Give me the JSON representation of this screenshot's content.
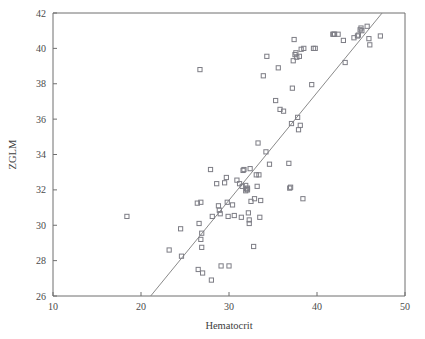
{
  "chart_data": {
    "type": "scatter",
    "title": "",
    "xlabel": "Hematocrit",
    "ylabel": "ZGLM",
    "xlim": [
      10,
      50
    ],
    "ylim": [
      26,
      42
    ],
    "xticks": [
      10,
      20,
      30,
      40,
      50
    ],
    "yticks": [
      26,
      28,
      30,
      32,
      34,
      36,
      38,
      40,
      42
    ],
    "grid": false,
    "legend": null,
    "marker_style": "open-square",
    "fit_line": {
      "label": "regression-line",
      "x": [
        21.1,
        47.4
      ],
      "y": [
        26.0,
        42.0
      ]
    },
    "points": [
      [
        18.4,
        30.5
      ],
      [
        23.2,
        28.6
      ],
      [
        24.5,
        29.8
      ],
      [
        24.6,
        28.25
      ],
      [
        26.4,
        31.25
      ],
      [
        26.5,
        27.5
      ],
      [
        26.6,
        30.1
      ],
      [
        26.7,
        38.8
      ],
      [
        26.8,
        31.3
      ],
      [
        26.8,
        29.2
      ],
      [
        26.9,
        28.75
      ],
      [
        26.9,
        29.55
      ],
      [
        27.0,
        27.3
      ],
      [
        27.9,
        33.15
      ],
      [
        28.0,
        26.9
      ],
      [
        28.1,
        30.5
      ],
      [
        28.6,
        32.35
      ],
      [
        28.8,
        31.1
      ],
      [
        28.9,
        30.85
      ],
      [
        29.0,
        30.65
      ],
      [
        29.1,
        27.7
      ],
      [
        29.5,
        32.4
      ],
      [
        29.7,
        32.7
      ],
      [
        29.8,
        31.3
      ],
      [
        29.9,
        30.5
      ],
      [
        30.0,
        27.7
      ],
      [
        30.4,
        31.15
      ],
      [
        30.6,
        30.55
      ],
      [
        30.9,
        32.55
      ],
      [
        31.2,
        32.35
      ],
      [
        31.4,
        30.45
      ],
      [
        31.5,
        32.2
      ],
      [
        31.6,
        33.1
      ],
      [
        31.7,
        33.15
      ],
      [
        31.9,
        32.25
      ],
      [
        31.9,
        31.95
      ],
      [
        32.0,
        32.05
      ],
      [
        32.1,
        32.1
      ],
      [
        32.1,
        32.0
      ],
      [
        32.2,
        30.7
      ],
      [
        32.3,
        30.3
      ],
      [
        32.3,
        30.1
      ],
      [
        32.4,
        33.2
      ],
      [
        32.5,
        31.35
      ],
      [
        32.8,
        28.8
      ],
      [
        32.9,
        31.5
      ],
      [
        33.1,
        32.85
      ],
      [
        33.2,
        32.2
      ],
      [
        33.3,
        34.65
      ],
      [
        33.4,
        32.85
      ],
      [
        33.5,
        30.45
      ],
      [
        33.6,
        31.4
      ],
      [
        33.9,
        38.45
      ],
      [
        34.2,
        34.15
      ],
      [
        34.3,
        39.55
      ],
      [
        34.6,
        33.45
      ],
      [
        35.3,
        37.05
      ],
      [
        35.6,
        38.9
      ],
      [
        35.8,
        36.55
      ],
      [
        36.2,
        36.45
      ],
      [
        36.8,
        33.5
      ],
      [
        36.9,
        32.1
      ],
      [
        37.0,
        32.15
      ],
      [
        37.1,
        35.75
      ],
      [
        37.2,
        37.75
      ],
      [
        37.3,
        39.3
      ],
      [
        37.4,
        40.5
      ],
      [
        37.5,
        39.65
      ],
      [
        37.6,
        39.75
      ],
      [
        37.7,
        39.5
      ],
      [
        37.8,
        36.1
      ],
      [
        37.9,
        35.4
      ],
      [
        38.0,
        39.55
      ],
      [
        38.1,
        35.65
      ],
      [
        38.2,
        39.95
      ],
      [
        38.4,
        31.5
      ],
      [
        38.5,
        40.0
      ],
      [
        39.4,
        37.95
      ],
      [
        39.6,
        40.0
      ],
      [
        39.8,
        40.0
      ],
      [
        41.8,
        40.8
      ],
      [
        41.9,
        40.8
      ],
      [
        42.0,
        40.8
      ],
      [
        42.4,
        40.8
      ],
      [
        43.0,
        40.45
      ],
      [
        43.2,
        39.2
      ],
      [
        44.2,
        40.6
      ],
      [
        44.6,
        40.7
      ],
      [
        44.7,
        40.75
      ],
      [
        44.9,
        41.05
      ],
      [
        45.0,
        41.15
      ],
      [
        45.1,
        41.0
      ],
      [
        45.7,
        41.25
      ],
      [
        45.9,
        40.55
      ],
      [
        46.0,
        40.2
      ],
      [
        47.2,
        40.7
      ]
    ]
  }
}
